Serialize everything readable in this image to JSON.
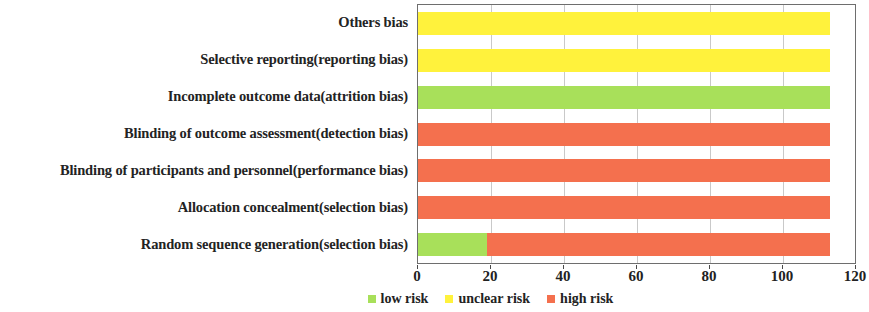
{
  "chart_data": {
    "type": "bar",
    "orientation": "horizontal",
    "stacked": true,
    "title": "",
    "xlabel": "",
    "ylabel": "",
    "xlim": [
      0,
      120
    ],
    "xticks": [
      0,
      20,
      40,
      60,
      80,
      100,
      120
    ],
    "xtick_labels": [
      "0",
      "20",
      "40",
      "60",
      "80",
      "100",
      "120"
    ],
    "grid": true,
    "grid_axis": "x",
    "legend_position": "bottom",
    "total": 113,
    "categories": [
      "Random sequence generation(selection bias)",
      "Allocation concealment(selection bias)",
      "Blinding of participants and personnel(performance bias)",
      "Blinding of outcome assessment(detection bias)",
      "Incomplete outcome data(attrition bias)",
      "Selective reporting(reporting bias)",
      "Others bias"
    ],
    "series": [
      {
        "name": "low risk",
        "color": "#a8e05a",
        "values": [
          19,
          0,
          0,
          0,
          113,
          0,
          0
        ]
      },
      {
        "name": "unclear risk",
        "color": "#fff23c",
        "values": [
          0,
          0,
          0,
          0,
          0,
          113,
          113
        ]
      },
      {
        "name": "high risk",
        "color": "#f4704e",
        "values": [
          94,
          113,
          113,
          113,
          0,
          0,
          0
        ]
      }
    ],
    "legend": [
      {
        "label": "low risk",
        "color": "#a8e05a"
      },
      {
        "label": "unclear risk",
        "color": "#fff23c"
      },
      {
        "label": "high risk",
        "color": "#f4704e"
      }
    ]
  },
  "colors": {
    "low_risk": "#a8e05a",
    "unclear_risk": "#fff23c",
    "high_risk": "#f4704e",
    "axis": "#6e6e6e",
    "gridline": "#c9c9c9",
    "text": "#232323"
  }
}
